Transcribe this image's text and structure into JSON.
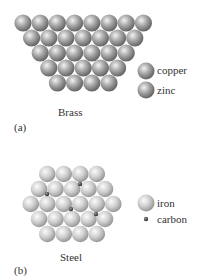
{
  "panel_a": {
    "caption": "Brass",
    "tag": "(a)",
    "legend": [
      {
        "label": "copper",
        "color": "#9a9a9a"
      },
      {
        "label": "zinc",
        "color": "#8a8a8a"
      }
    ],
    "rows": [
      8,
      7,
      6,
      5,
      4
    ]
  },
  "panel_b": {
    "caption": "Steel",
    "tag": "(b)",
    "legend": [
      {
        "label": "iron",
        "color": "#c4c4c4"
      },
      {
        "label": "carbon",
        "color": "#3a3a3a"
      }
    ],
    "rows": [
      4,
      5,
      6,
      5,
      4
    ]
  }
}
